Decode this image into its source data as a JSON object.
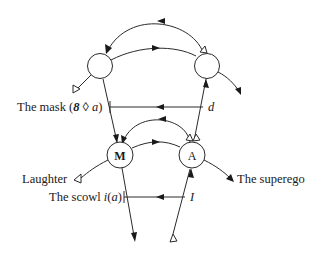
{
  "diagram": {
    "type": "graph-of-desire-variant",
    "nodes": [
      {
        "id": "top-left",
        "label": ""
      },
      {
        "id": "top-right",
        "label": ""
      },
      {
        "id": "M",
        "label": "M"
      },
      {
        "id": "A",
        "label": "A"
      }
    ],
    "labels": {
      "mask": "The mask (",
      "mask_symbol": "8 ◊ ",
      "mask_a": "a",
      "mask_close": ")",
      "d": "d",
      "laughter": "Laughter",
      "scowl": "The scowl ",
      "scowl_i": "i",
      "scowl_open": "(",
      "scowl_a": "a",
      "scowl_close": ")",
      "I": "I",
      "superego": "The superego"
    },
    "edges": [
      {
        "from": "top-right",
        "to": "top-left",
        "style": "outer upper arc",
        "head": "filled",
        "tail": "open"
      },
      {
        "from": "top-left",
        "to": "top-right",
        "style": "inner upper arc",
        "head": "filled-midpoint"
      },
      {
        "from": "top-left",
        "to": "M",
        "style": "line"
      },
      {
        "from": "A",
        "to": "top-right",
        "style": "line",
        "head": "filled"
      },
      {
        "from": "d",
        "to": "The mask (8 ◊ a)",
        "style": "horizontal",
        "head": "filled-midpoint"
      },
      {
        "from": "A",
        "to": "M",
        "style": "outer lower arc",
        "head": "filled",
        "tail": "open"
      },
      {
        "from": "M",
        "to": "A",
        "style": "inner lower arc",
        "head": "filled-midpoint"
      },
      {
        "from": "I",
        "to": "The scowl i(a)",
        "style": "horizontal",
        "head": "filled-midpoint"
      },
      {
        "from": "M",
        "to": "bottom",
        "style": "line",
        "head": "filled"
      },
      {
        "from": "bottom",
        "to": "A",
        "style": "line",
        "head": "filled",
        "tail": "open"
      },
      {
        "from": "M",
        "to": "Laughter",
        "style": "curve",
        "head": "open"
      },
      {
        "from": "A",
        "to": "The superego",
        "style": "curve",
        "head": "filled"
      },
      {
        "from": "top-left",
        "to": "lower-left",
        "style": "line",
        "head": "open"
      },
      {
        "from": "top-right",
        "to": "lower-right",
        "style": "curve",
        "head": "filled"
      }
    ]
  }
}
